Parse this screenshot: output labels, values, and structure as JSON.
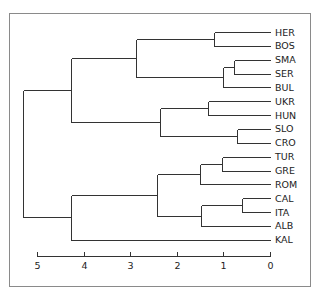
{
  "chart_data": {
    "type": "dendrogram",
    "title": "",
    "xlabel": "",
    "ylabel": "",
    "orientation": "leaves-right",
    "xlim": [
      5,
      0
    ],
    "x_ticks": [
      5,
      4,
      3,
      2,
      1,
      0
    ],
    "x_tick_labels": [
      "5",
      "4",
      "3",
      "2",
      "1",
      "0"
    ],
    "grid": false,
    "leaves": [
      "HER",
      "BOS",
      "SMA",
      "SER",
      "BUL",
      "UKR",
      "HUN",
      "SLO",
      "CRO",
      "TUR",
      "GRE",
      "ROM",
      "CAL",
      "ITA",
      "ALB",
      "KAL"
    ],
    "merges": [
      {
        "id": "m1",
        "children": [
          "HER",
          "BOS"
        ],
        "height": 1.2
      },
      {
        "id": "m2",
        "children": [
          "SMA",
          "SER"
        ],
        "height": 0.77
      },
      {
        "id": "m3",
        "children": [
          "m2",
          "BUL"
        ],
        "height": 1.0
      },
      {
        "id": "m4",
        "children": [
          "m1",
          "m3"
        ],
        "height": 2.87
      },
      {
        "id": "m5",
        "children": [
          "UKR",
          "HUN"
        ],
        "height": 1.33
      },
      {
        "id": "m6",
        "children": [
          "SLO",
          "CRO"
        ],
        "height": 0.7
      },
      {
        "id": "m7",
        "children": [
          "m5",
          "m6"
        ],
        "height": 2.35
      },
      {
        "id": "m8",
        "children": [
          "m4",
          "m7"
        ],
        "height": 4.27
      },
      {
        "id": "m9",
        "children": [
          "TUR",
          "GRE"
        ],
        "height": 1.03
      },
      {
        "id": "m10",
        "children": [
          "m9",
          "ROM"
        ],
        "height": 1.5
      },
      {
        "id": "m11",
        "children": [
          "CAL",
          "ITA"
        ],
        "height": 0.6
      },
      {
        "id": "m12",
        "children": [
          "m11",
          "ALB"
        ],
        "height": 1.48
      },
      {
        "id": "m13",
        "children": [
          "m10",
          "m12"
        ],
        "height": 2.43
      },
      {
        "id": "m14",
        "children": [
          "m13",
          "KAL"
        ],
        "height": 4.27
      },
      {
        "id": "m15",
        "children": [
          "m8",
          "m14"
        ],
        "height": 5.3
      }
    ]
  },
  "colors": {
    "line": "#333333",
    "frame": "#8a8a8a",
    "text": "#222222"
  }
}
